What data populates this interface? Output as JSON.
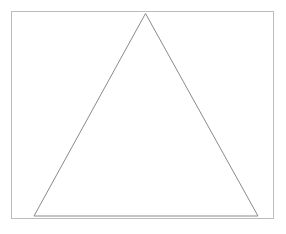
{
  "figure": {
    "background_color": "#ffffff",
    "canvas": {
      "width": 286,
      "height": 234
    },
    "frame": {
      "name": "border-rectangle",
      "x": 11,
      "y": 11,
      "width": 263,
      "height": 208,
      "stroke_color": "#bcbcbc",
      "stroke_width": 1,
      "fill": "none"
    },
    "shapes": [
      {
        "name": "triangle",
        "type": "polygon",
        "sides": 3,
        "vertices": [
          {
            "label": "apex",
            "x": 145.5,
            "y": 13.5
          },
          {
            "label": "bottom-right",
            "x": 258,
            "y": 216
          },
          {
            "label": "bottom-left",
            "x": 34,
            "y": 216
          }
        ],
        "stroke_color": "#8a8a8a",
        "stroke_width": 1,
        "fill": "none"
      }
    ],
    "caption": ""
  }
}
